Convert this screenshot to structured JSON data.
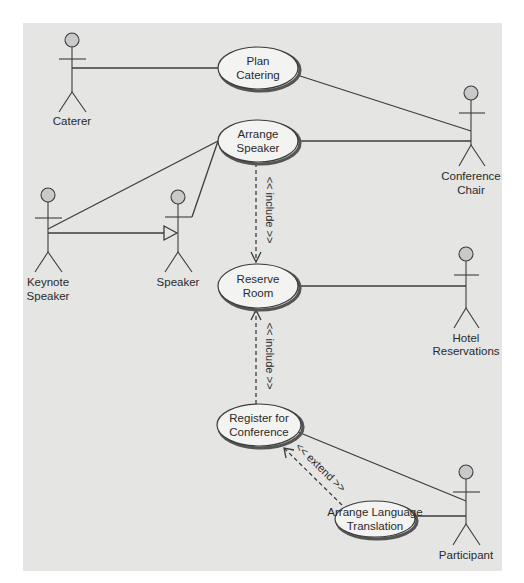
{
  "diagram": {
    "type": "UML use case diagram",
    "colors": {
      "panel": "#e5e5e3",
      "line": "#3d3d3d",
      "use_case_fill": "#f3f3f1",
      "actor_head": "#c9c9c9"
    }
  },
  "actors": {
    "caterer": {
      "label": "Caterer"
    },
    "keynote_speaker": {
      "line1": "Keynote",
      "line2": "Speaker"
    },
    "speaker": {
      "label": "Speaker"
    },
    "conference_chair": {
      "line1": "Conference",
      "line2": "Chair"
    },
    "hotel_reservations": {
      "line1": "Hotel",
      "line2": "Reservations"
    },
    "participant": {
      "label": "Participant"
    }
  },
  "use_cases": {
    "plan_catering": {
      "line1": "Plan",
      "line2": "Catering"
    },
    "arrange_speaker": {
      "line1": "Arrange",
      "line2": "Speaker"
    },
    "reserve_room": {
      "line1": "Reserve",
      "line2": "Room"
    },
    "register_conference": {
      "line1": "Register for",
      "line2": "Conference"
    },
    "arrange_translation": {
      "line1": "Arrange Language",
      "line2": "Translation"
    }
  },
  "relationships": {
    "include_1": {
      "label": "<< include >>",
      "from": "Arrange Speaker",
      "to": "Reserve Room"
    },
    "include_2": {
      "label": "<< include >>",
      "from": "Register for Conference",
      "to": "Reserve Room"
    },
    "extend_1": {
      "label": "<< extend >>",
      "from": "Arrange Language Translation",
      "to": "Register for Conference"
    },
    "generalization": {
      "from": "Keynote Speaker",
      "to": "Speaker"
    }
  }
}
